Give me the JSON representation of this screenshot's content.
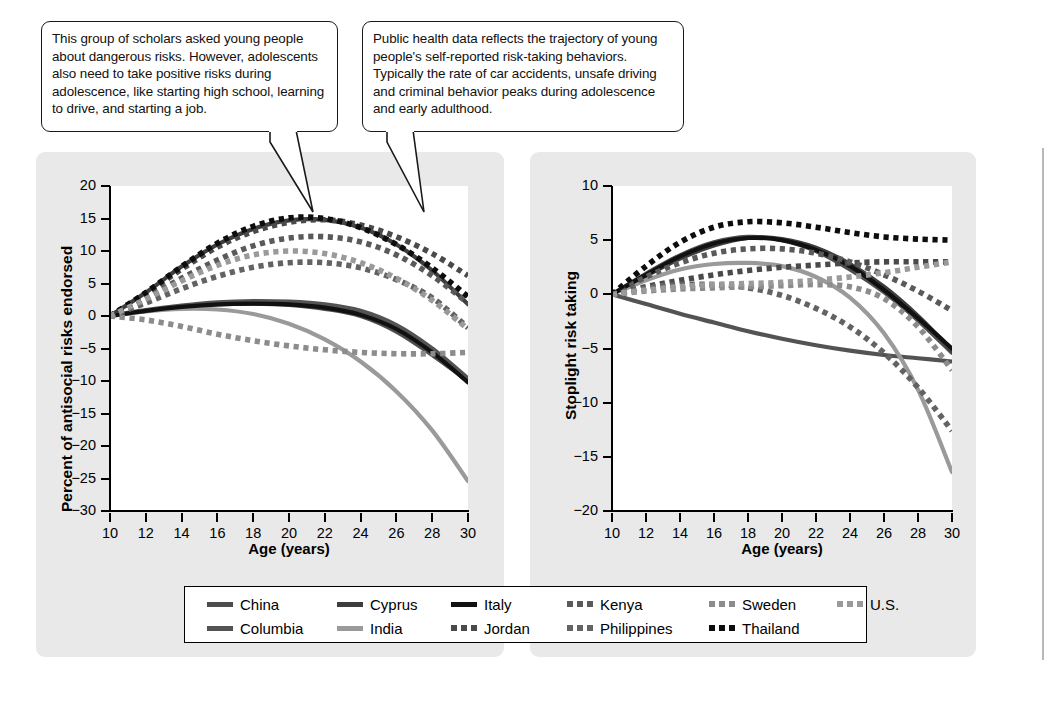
{
  "callouts": [
    {
      "id": "callout-left",
      "text": "This group of scholars asked young people about dangerous risks. However, adolescents also need to take positive risks during adolescence, like starting high school, learning to drive, and starting a job."
    },
    {
      "id": "callout-right",
      "text": "Public health data reflects the trajectory of young people's self-reported risk-taking behaviors. Typically the rate of car accidents, unsafe driving and criminal behavior peaks during adolescence and early adulthood."
    }
  ],
  "legend": {
    "rows": [
      [
        {
          "label": "China",
          "style": "solid",
          "color": "#4d4d4d"
        },
        {
          "label": "Cyprus",
          "style": "solid",
          "color": "#3d3d3d"
        },
        {
          "label": "Italy",
          "style": "solid",
          "color": "#111111"
        },
        {
          "label": "Kenya",
          "style": "dotted",
          "color": "#5a5a5a"
        },
        {
          "label": "Sweden",
          "style": "dotted",
          "color": "#8c8c8c"
        },
        {
          "label": "U.S.",
          "style": "dotted",
          "color": "#9a9a9a"
        }
      ],
      [
        {
          "label": "Columbia",
          "style": "solid",
          "color": "#535353"
        },
        {
          "label": "India",
          "style": "solid",
          "color": "#9a9a9a"
        },
        {
          "label": "Jordan",
          "style": "dotted",
          "color": "#4a4a4a"
        },
        {
          "label": "Philippines",
          "style": "dotted",
          "color": "#636363"
        },
        {
          "label": "Thailand",
          "style": "dotted",
          "color": "#0d0d0d"
        }
      ]
    ]
  },
  "chart_data": [
    {
      "id": "chart-antisocial",
      "type": "line",
      "title": "",
      "xlabel": "Age (years)",
      "ylabel": "Percent of antisocial risks endorsed",
      "xlim": [
        10,
        30
      ],
      "ylim": [
        -30,
        20
      ],
      "xticks": [
        10,
        12,
        14,
        16,
        18,
        20,
        22,
        24,
        26,
        28,
        30
      ],
      "yticks": [
        20,
        15,
        10,
        5,
        0,
        -5,
        -10,
        -15,
        -20,
        -25,
        -30
      ],
      "grid": false,
      "legend_position": "bottom",
      "x": [
        10,
        12,
        14,
        16,
        18,
        20,
        22,
        24,
        26,
        28,
        30
      ],
      "series": [
        {
          "name": "China",
          "style": "solid",
          "color": "#4d4d4d",
          "values": [
            0,
            0.8,
            1.4,
            1.8,
            1.9,
            1.7,
            1.1,
            0.0,
            -2.4,
            -6.0,
            -10.0
          ]
        },
        {
          "name": "Columbia",
          "style": "solid",
          "color": "#535353",
          "values": [
            0,
            0.9,
            1.6,
            2.1,
            2.3,
            2.2,
            1.8,
            0.8,
            -1.4,
            -5.0,
            -9.6
          ]
        },
        {
          "name": "Cyprus",
          "style": "solid",
          "color": "#3d3d3d",
          "values": [
            0,
            3.6,
            7.6,
            11.0,
            13.4,
            14.7,
            14.8,
            13.6,
            11.0,
            7.0,
            1.8
          ]
        },
        {
          "name": "India",
          "style": "solid",
          "color": "#9a9a9a",
          "values": [
            0,
            0.7,
            1.1,
            1.0,
            0.3,
            -1.2,
            -3.6,
            -7.0,
            -11.6,
            -17.6,
            -25.4
          ]
        },
        {
          "name": "Italy",
          "style": "solid",
          "color": "#111111",
          "values": [
            0,
            0.8,
            1.4,
            1.8,
            1.9,
            1.8,
            1.3,
            0.2,
            -2.0,
            -5.6,
            -10.2
          ]
        },
        {
          "name": "Jordan",
          "style": "dotted",
          "color": "#4a4a4a",
          "values": [
            0,
            3.4,
            7.2,
            10.6,
            13.0,
            14.4,
            14.8,
            14.0,
            12.2,
            9.6,
            6.2
          ]
        },
        {
          "name": "Kenya",
          "style": "dotted",
          "color": "#5a5a5a",
          "values": [
            0,
            2.8,
            5.8,
            8.6,
            10.8,
            12.0,
            12.2,
            11.4,
            9.4,
            6.2,
            2.0
          ]
        },
        {
          "name": "Philippines",
          "style": "dotted",
          "color": "#636363",
          "values": [
            0,
            2.0,
            4.2,
            6.1,
            7.5,
            8.2,
            8.2,
            7.4,
            5.6,
            2.8,
            -1.8
          ]
        },
        {
          "name": "Sweden",
          "style": "dotted",
          "color": "#8c8c8c",
          "values": [
            0,
            -0.6,
            -1.6,
            -2.8,
            -3.8,
            -4.6,
            -5.2,
            -5.6,
            -5.8,
            -5.8,
            -5.6
          ]
        },
        {
          "name": "Thailand",
          "style": "dotted",
          "color": "#0d0d0d",
          "values": [
            0,
            3.6,
            7.6,
            11.2,
            13.8,
            15.1,
            15.0,
            13.6,
            11.0,
            7.4,
            3.0
          ]
        },
        {
          "name": "U.S.",
          "style": "dotted",
          "color": "#9a9a9a",
          "values": [
            0,
            2.6,
            5.4,
            7.8,
            9.4,
            10.0,
            9.6,
            8.2,
            5.8,
            2.4,
            -2.0
          ]
        }
      ]
    },
    {
      "id": "chart-stoplight",
      "type": "line",
      "title": "",
      "xlabel": "Age (years)",
      "ylabel": "Stoplight risk taking",
      "xlim": [
        10,
        30
      ],
      "ylim": [
        -20,
        10
      ],
      "xticks": [
        10,
        12,
        14,
        16,
        18,
        20,
        22,
        24,
        26,
        28,
        30
      ],
      "yticks": [
        10,
        5,
        0,
        -5,
        -10,
        -15,
        -20
      ],
      "grid": false,
      "legend_position": "bottom",
      "x": [
        10,
        12,
        14,
        16,
        18,
        20,
        22,
        24,
        26,
        28,
        30
      ],
      "series": [
        {
          "name": "China",
          "style": "solid",
          "color": "#4d4d4d",
          "values": [
            0,
            1.9,
            3.6,
            4.8,
            5.3,
            5.0,
            4.0,
            2.3,
            0.2,
            -2.4,
            -5.4
          ]
        },
        {
          "name": "Columbia",
          "style": "solid",
          "color": "#535353",
          "values": [
            0,
            -0.9,
            -1.8,
            -2.6,
            -3.4,
            -4.1,
            -4.7,
            -5.2,
            -5.6,
            -5.9,
            -6.2
          ]
        },
        {
          "name": "Cyprus",
          "style": "solid",
          "color": "#3d3d3d",
          "values": [
            0,
            1.7,
            3.3,
            4.5,
            5.2,
            5.1,
            4.3,
            2.8,
            0.7,
            -2.0,
            -5.2
          ]
        },
        {
          "name": "India",
          "style": "solid",
          "color": "#9a9a9a",
          "values": [
            0,
            1.3,
            2.3,
            2.8,
            2.9,
            2.6,
            1.6,
            -0.3,
            -3.6,
            -8.8,
            -16.4
          ]
        },
        {
          "name": "Italy",
          "style": "solid",
          "color": "#111111",
          "values": [
            0,
            1.8,
            3.5,
            4.7,
            5.2,
            5.0,
            4.1,
            2.6,
            0.4,
            -2.2,
            -5.0
          ]
        },
        {
          "name": "Jordan",
          "style": "dotted",
          "color": "#4a4a4a",
          "values": [
            0,
            0.7,
            1.3,
            1.8,
            2.2,
            2.5,
            2.7,
            2.9,
            3.0,
            3.0,
            3.0
          ]
        },
        {
          "name": "Kenya",
          "style": "dotted",
          "color": "#5a5a5a",
          "values": [
            0,
            1.6,
            2.9,
            3.8,
            4.2,
            4.2,
            3.8,
            3.0,
            1.8,
            0.3,
            -1.5
          ]
        },
        {
          "name": "Philippines",
          "style": "dotted",
          "color": "#636363",
          "values": [
            0,
            0.6,
            0.9,
            0.9,
            0.6,
            -0.1,
            -1.3,
            -3.0,
            -5.4,
            -8.6,
            -12.6
          ]
        },
        {
          "name": "Sweden",
          "style": "dotted",
          "color": "#8c8c8c",
          "values": [
            0,
            0.3,
            0.5,
            0.6,
            0.7,
            0.8,
            0.9,
            0.7,
            -0.4,
            -3.0,
            -7.0
          ]
        },
        {
          "name": "Thailand",
          "style": "dotted",
          "color": "#0d0d0d",
          "values": [
            0,
            2.6,
            4.8,
            6.2,
            6.7,
            6.6,
            6.2,
            5.7,
            5.3,
            5.1,
            5.0
          ]
        },
        {
          "name": "U.S.",
          "style": "dotted",
          "color": "#9a9a9a",
          "values": [
            0,
            0.4,
            0.7,
            0.9,
            1.0,
            1.1,
            1.3,
            1.6,
            2.0,
            2.5,
            3.0
          ]
        }
      ]
    }
  ]
}
